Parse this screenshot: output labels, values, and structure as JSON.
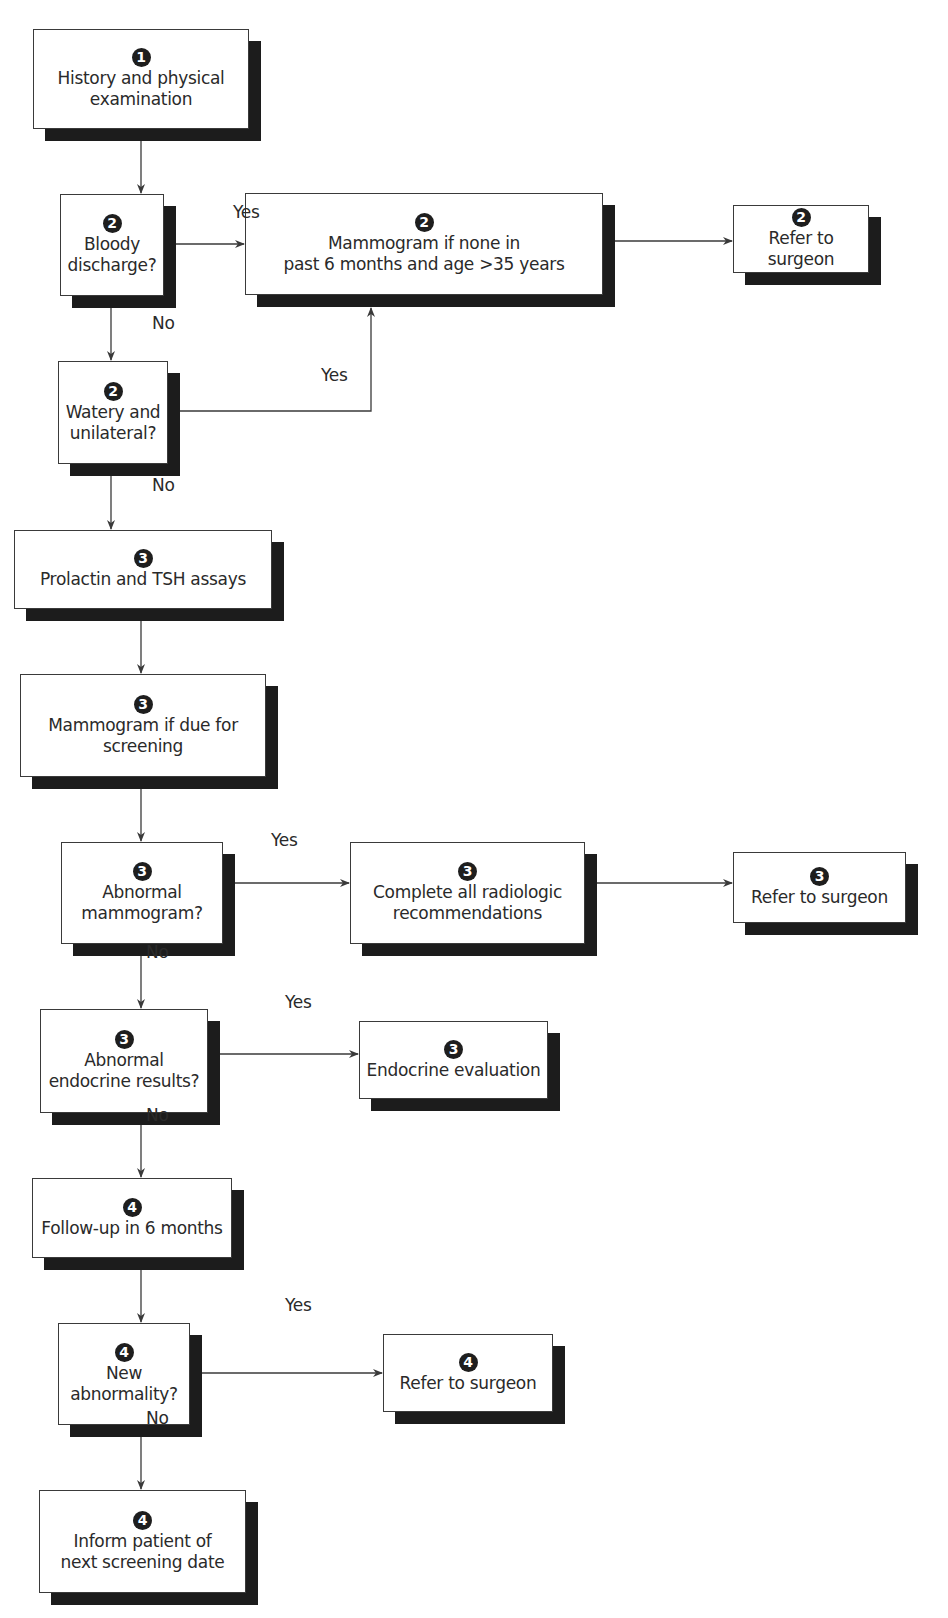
{
  "nodes": [
    {
      "id": "n1",
      "step": "1",
      "text": "History and physical\nexamination",
      "type": "process",
      "x": 33,
      "y": 29,
      "w": 216,
      "h": 100
    },
    {
      "id": "n2",
      "step": "2",
      "text": "Bloody\ndischarge?",
      "type": "decision",
      "x": 60,
      "y": 194,
      "w": 104,
      "h": 102
    },
    {
      "id": "n3",
      "step": "2",
      "text": "Mammogram if none in\npast 6 months and age >35 years",
      "type": "process",
      "x": 245,
      "y": 193,
      "w": 358,
      "h": 102
    },
    {
      "id": "n4",
      "step": "2",
      "text": "Refer to surgeon",
      "type": "terminal",
      "x": 733,
      "y": 205,
      "w": 136,
      "h": 68
    },
    {
      "id": "n5",
      "step": "2",
      "text": "Watery and\nunilateral?",
      "type": "decision",
      "x": 58,
      "y": 361,
      "w": 110,
      "h": 103
    },
    {
      "id": "n6",
      "step": "3",
      "text": "Prolactin and TSH assays",
      "type": "process",
      "x": 14,
      "y": 530,
      "w": 258,
      "h": 79
    },
    {
      "id": "n7",
      "step": "3",
      "text": "Mammogram if due for\nscreening",
      "type": "process",
      "x": 20,
      "y": 674,
      "w": 246,
      "h": 103
    },
    {
      "id": "n8",
      "step": "3",
      "text": "Abnormal\nmammogram?",
      "type": "decision",
      "x": 61,
      "y": 842,
      "w": 162,
      "h": 102
    },
    {
      "id": "n9",
      "step": "3",
      "text": "Complete all radiologic\nrecommendations",
      "type": "process",
      "x": 350,
      "y": 842,
      "w": 235,
      "h": 102
    },
    {
      "id": "n10",
      "step": "3",
      "text": "Refer to surgeon",
      "type": "terminal",
      "x": 733,
      "y": 852,
      "w": 173,
      "h": 71
    },
    {
      "id": "n11",
      "step": "3",
      "text": "Abnormal\nendocrine results?",
      "type": "decision",
      "x": 40,
      "y": 1009,
      "w": 168,
      "h": 104
    },
    {
      "id": "n12",
      "step": "3",
      "text": "Endocrine evaluation",
      "type": "terminal",
      "x": 359,
      "y": 1021,
      "w": 189,
      "h": 78
    },
    {
      "id": "n13",
      "step": "4",
      "text": "Follow-up in 6 months",
      "type": "process",
      "x": 32,
      "y": 1178,
      "w": 200,
      "h": 80
    },
    {
      "id": "n14",
      "step": "4",
      "text": "New\nabnormality?",
      "type": "decision",
      "x": 58,
      "y": 1323,
      "w": 132,
      "h": 102
    },
    {
      "id": "n15",
      "step": "4",
      "text": "Refer to surgeon",
      "type": "terminal",
      "x": 383,
      "y": 1334,
      "w": 170,
      "h": 78
    },
    {
      "id": "n16",
      "step": "4",
      "text": "Inform patient of\nnext screening date",
      "type": "terminal",
      "x": 39,
      "y": 1490,
      "w": 207,
      "h": 103
    }
  ],
  "edges": [
    {
      "from": "n1",
      "to": "n2",
      "label": ""
    },
    {
      "from": "n2",
      "to": "n3",
      "label": "Yes"
    },
    {
      "from": "n3",
      "to": "n4",
      "label": ""
    },
    {
      "from": "n2",
      "to": "n5",
      "label": "No"
    },
    {
      "from": "n5",
      "to": "n3",
      "label": "Yes"
    },
    {
      "from": "n5",
      "to": "n6",
      "label": "No"
    },
    {
      "from": "n6",
      "to": "n7",
      "label": ""
    },
    {
      "from": "n7",
      "to": "n8",
      "label": ""
    },
    {
      "from": "n8",
      "to": "n9",
      "label": "Yes"
    },
    {
      "from": "n9",
      "to": "n10",
      "label": ""
    },
    {
      "from": "n8",
      "to": "n11",
      "label": "No"
    },
    {
      "from": "n11",
      "to": "n12",
      "label": "Yes"
    },
    {
      "from": "n11",
      "to": "n13",
      "label": "No"
    },
    {
      "from": "n13",
      "to": "n14",
      "label": ""
    },
    {
      "from": "n14",
      "to": "n15",
      "label": "Yes"
    },
    {
      "from": "n14",
      "to": "n16",
      "label": "No"
    }
  ],
  "edge_labels": [
    {
      "text": "Yes",
      "x": 233,
      "y": 202
    },
    {
      "text": "No",
      "x": 152,
      "y": 313
    },
    {
      "text": "Yes",
      "x": 321,
      "y": 365
    },
    {
      "text": "No",
      "x": 152,
      "y": 475
    },
    {
      "text": "Yes",
      "x": 271,
      "y": 830
    },
    {
      "text": "No",
      "x": 146,
      "y": 942
    },
    {
      "text": "Yes",
      "x": 285,
      "y": 992
    },
    {
      "text": "No",
      "x": 146,
      "y": 1105
    },
    {
      "text": "Yes",
      "x": 285,
      "y": 1295
    },
    {
      "text": "No",
      "x": 146,
      "y": 1408
    }
  ],
  "style": {
    "line_color": "#3a3a3a",
    "shadow_color": "#1c1c1c",
    "badge_color": "#1e1e1e",
    "text_color": "#2a2a2a",
    "shadow_offset": 12
  }
}
